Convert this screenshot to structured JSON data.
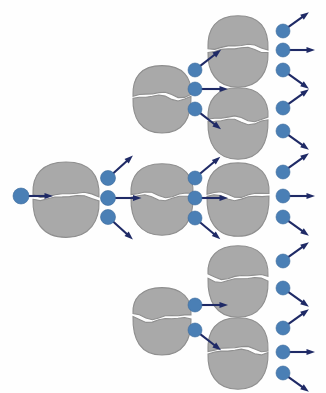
{
  "figure": {
    "background_color": "#fefefe",
    "width": 326,
    "height": 393
  },
  "palette": {
    "nucleus_fill": "#a9a9a9",
    "nucleus_stroke": "#8f8f8f",
    "neutron_fill": "#4a7fb5",
    "neutron_stroke": "#3a6a9c",
    "arrow_color": "#1f2a66",
    "split_gap": "#ffffff"
  },
  "legend": {
    "nucleus_label": "fissile nucleus (split into two fragments)",
    "neutron_label": "neutron",
    "arrow_label": "neutron direction of travel"
  },
  "chart_data": {
    "type": "diagram",
    "generations": 4,
    "generation_labels": [
      "incident neutron",
      "generation 1",
      "generation 2",
      "generation 3"
    ],
    "nuclei_per_generation": [
      1,
      3,
      4,
      0
    ],
    "neutrons_per_generation": [
      1,
      3,
      8,
      11
    ],
    "nuclei": [
      {
        "id": "n-g1-mid",
        "generation": 1,
        "cx": 66,
        "cy": 196,
        "rx": 33,
        "ry": 37,
        "emits": 3
      },
      {
        "id": "n-g2-top",
        "generation": 2,
        "cx": 162,
        "cy": 96,
        "rx": 29,
        "ry": 33,
        "emits": 3
      },
      {
        "id": "n-g2-mid",
        "generation": 2,
        "cx": 162,
        "cy": 196,
        "rx": 31,
        "ry": 35,
        "emits": 3
      },
      {
        "id": "n-g2-bot",
        "generation": 2,
        "cx": 162,
        "cy": 318,
        "rx": 29,
        "ry": 33,
        "emits": 2
      },
      {
        "id": "n-g3-1",
        "generation": 3,
        "cx": 238,
        "cy": 48,
        "rx": 30,
        "ry": 35,
        "emits": 3
      },
      {
        "id": "n-g3-2",
        "generation": 3,
        "cx": 238,
        "cy": 120,
        "rx": 30,
        "ry": 35,
        "emits": 2
      },
      {
        "id": "n-g3-3",
        "generation": 3,
        "cx": 238,
        "cy": 196,
        "rx": 31,
        "ry": 36,
        "emits": 3
      },
      {
        "id": "n-g3-4",
        "generation": 3,
        "cx": 238,
        "cy": 278,
        "rx": 30,
        "ry": 35,
        "emits": 2
      },
      {
        "id": "n-g3-5",
        "generation": 3,
        "cx": 238,
        "cy": 350,
        "rx": 30,
        "ry": 35,
        "emits": 3
      }
    ],
    "neutrons": [
      {
        "id": "nt-incident",
        "generation": 0,
        "cx": 21,
        "cy": 196,
        "r": 8,
        "angle_deg": 0,
        "length": 24
      },
      {
        "id": "nt-g1-up",
        "generation": 1,
        "cx": 108,
        "cy": 178,
        "r": 7.5,
        "angle_deg": -42,
        "length": 26
      },
      {
        "id": "nt-g1-flat",
        "generation": 1,
        "cx": 108,
        "cy": 198,
        "r": 7.5,
        "angle_deg": 0,
        "length": 26
      },
      {
        "id": "nt-g1-down",
        "generation": 1,
        "cx": 108,
        "cy": 217,
        "r": 7.5,
        "angle_deg": 42,
        "length": 26
      },
      {
        "id": "nt-g2a-up",
        "generation": 2,
        "cx": 195,
        "cy": 70,
        "r": 7,
        "angle_deg": -38,
        "length": 26
      },
      {
        "id": "nt-g2a-flat",
        "generation": 2,
        "cx": 195,
        "cy": 89,
        "r": 7,
        "angle_deg": 0,
        "length": 26
      },
      {
        "id": "nt-g2a-down",
        "generation": 2,
        "cx": 195,
        "cy": 109,
        "r": 7,
        "angle_deg": 38,
        "length": 26
      },
      {
        "id": "nt-g2b-up",
        "generation": 2,
        "cx": 195,
        "cy": 178,
        "r": 7,
        "angle_deg": -40,
        "length": 26
      },
      {
        "id": "nt-g2b-flat",
        "generation": 2,
        "cx": 195,
        "cy": 198,
        "r": 7,
        "angle_deg": 0,
        "length": 26
      },
      {
        "id": "nt-g2b-down",
        "generation": 2,
        "cx": 195,
        "cy": 218,
        "r": 7,
        "angle_deg": 40,
        "length": 26
      },
      {
        "id": "nt-g2c-flat",
        "generation": 2,
        "cx": 195,
        "cy": 305,
        "r": 7,
        "angle_deg": 0,
        "length": 26
      },
      {
        "id": "nt-g2c-down",
        "generation": 2,
        "cx": 195,
        "cy": 330,
        "r": 7,
        "angle_deg": 38,
        "length": 26
      },
      {
        "id": "nt-g3-1",
        "generation": 3,
        "cx": 283,
        "cy": 31,
        "r": 7,
        "angle_deg": -36,
        "length": 25
      },
      {
        "id": "nt-g3-2",
        "generation": 3,
        "cx": 283,
        "cy": 50,
        "r": 7,
        "angle_deg": 0,
        "length": 25
      },
      {
        "id": "nt-g3-3",
        "generation": 3,
        "cx": 283,
        "cy": 70,
        "r": 7,
        "angle_deg": 36,
        "length": 25
      },
      {
        "id": "nt-g3-4",
        "generation": 3,
        "cx": 283,
        "cy": 108,
        "r": 7,
        "angle_deg": -36,
        "length": 25
      },
      {
        "id": "nt-g3-5",
        "generation": 3,
        "cx": 283,
        "cy": 131,
        "r": 7,
        "angle_deg": 36,
        "length": 25
      },
      {
        "id": "nt-g3-6",
        "generation": 3,
        "cx": 283,
        "cy": 172,
        "r": 7,
        "angle_deg": -36,
        "length": 25
      },
      {
        "id": "nt-g3-7",
        "generation": 3,
        "cx": 283,
        "cy": 196,
        "r": 7,
        "angle_deg": 0,
        "length": 25
      },
      {
        "id": "nt-g3-8",
        "generation": 3,
        "cx": 283,
        "cy": 217,
        "r": 7,
        "angle_deg": 36,
        "length": 25
      },
      {
        "id": "nt-g3-9",
        "generation": 3,
        "cx": 283,
        "cy": 261,
        "r": 7,
        "angle_deg": -36,
        "length": 25
      },
      {
        "id": "nt-g3-10",
        "generation": 3,
        "cx": 283,
        "cy": 288,
        "r": 7,
        "angle_deg": 36,
        "length": 25
      },
      {
        "id": "nt-g3-11",
        "generation": 3,
        "cx": 283,
        "cy": 328,
        "r": 7,
        "angle_deg": -36,
        "length": 25
      },
      {
        "id": "nt-g3-12",
        "generation": 3,
        "cx": 283,
        "cy": 352,
        "r": 7,
        "angle_deg": 0,
        "length": 25
      },
      {
        "id": "nt-g3-13",
        "generation": 3,
        "cx": 283,
        "cy": 373,
        "r": 7,
        "angle_deg": 36,
        "length": 25
      }
    ]
  }
}
